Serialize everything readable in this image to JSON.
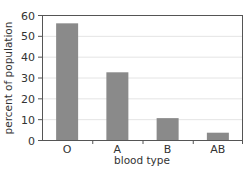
{
  "chart_data": {
    "type": "bar",
    "title": "",
    "xlabel": "blood type",
    "ylabel": "percent of population",
    "categories": [
      "O",
      "A",
      "B",
      "AB"
    ],
    "values": [
      56,
      32.5,
      10.5,
      3.5
    ],
    "ylim": [
      0,
      60
    ],
    "yticks": [
      0,
      10,
      20,
      30,
      40,
      50,
      60
    ],
    "grid": true,
    "legend": null,
    "colors": {
      "bar": "#8a8a8a",
      "grid": "#e4e4e4",
      "axis": "#555555"
    }
  }
}
